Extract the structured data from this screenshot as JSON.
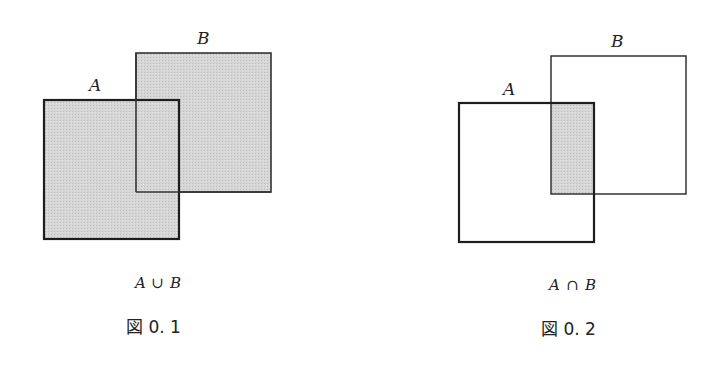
{
  "colors": {
    "fill": "#d4d4d4",
    "stroke_a": "#1e1e1e",
    "stroke_b": "#333333",
    "background": "#ffffff"
  },
  "figures": [
    {
      "id": "fig-0-1",
      "set_a_label": "A",
      "set_b_label": "B",
      "operation": "union",
      "caption_left": "A",
      "caption_op": "∪",
      "caption_right": "B",
      "figure_label": "図 0. 1",
      "shaded": "A ∪ B"
    },
    {
      "id": "fig-0-2",
      "set_a_label": "A",
      "set_b_label": "B",
      "operation": "intersection",
      "caption_left": "A",
      "caption_op": "∩",
      "caption_right": "B",
      "figure_label": "図 0. 2",
      "shaded": "A ∩ B"
    }
  ]
}
